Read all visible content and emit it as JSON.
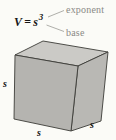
{
  "formula": {
    "variable": "V",
    "equals_sign": "=",
    "base_symbol": "s",
    "exponent_value": "3"
  },
  "annotations": {
    "exponent_label": "exponent",
    "base_label": "base"
  },
  "cube": {
    "left_side_label": "s",
    "bottom_side_label": "s",
    "right_side_label": "s"
  },
  "colors": {
    "background": "#fbfbf7",
    "top_face": "#cbcac6",
    "front_face": "#b5b4b0",
    "right_face": "#b9b8b4",
    "edge": "#3c3c38",
    "annotation_gray": "#8a8a86",
    "formula_text": "#161616"
  }
}
